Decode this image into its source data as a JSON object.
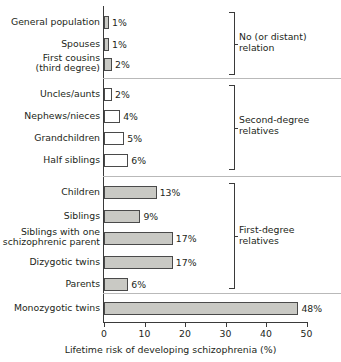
{
  "chart_data": {
    "type": "bar",
    "orientation": "horizontal",
    "title": "",
    "xlabel": "Lifetime risk of developing schizophrenia (%)",
    "ylabel": "",
    "xlim": [
      0,
      50
    ],
    "xticks": [
      0,
      10,
      20,
      30,
      40,
      50
    ],
    "xtick_labels": [
      "0",
      "10",
      "20",
      "30",
      "40",
      "50"
    ],
    "grid": false,
    "legend": false,
    "value_suffix": "%",
    "categories": [
      "General population",
      "Spouses",
      "First cousins\n(third degree)",
      "Uncles/aunts",
      "Nephews/nieces",
      "Grandchildren",
      "Half siblings",
      "Children",
      "Siblings",
      "Siblings with one\nschizophrenic parent",
      "Dizygotic twins",
      "Parents",
      "Monozygotic twins"
    ],
    "values": [
      1,
      1,
      2,
      2,
      4,
      5,
      6,
      13,
      9,
      17,
      17,
      6,
      48
    ],
    "value_labels": [
      "1%",
      "1%",
      "2%",
      "2%",
      "4%",
      "5%",
      "6%",
      "13%",
      "9%",
      "17%",
      "17%",
      "6%",
      "48%"
    ],
    "groups": [
      {
        "label": "No (or distant)\nrelation",
        "categories": [
          "General population",
          "Spouses",
          "First cousins (third degree)"
        ],
        "fill": "filled"
      },
      {
        "label": "Second-degree\nrelatives",
        "categories": [
          "Uncles/aunts",
          "Nephews/nieces",
          "Grandchildren",
          "Half siblings"
        ],
        "fill": "hollow"
      },
      {
        "label": "First-degree\nrelatives",
        "categories": [
          "Children",
          "Siblings",
          "Siblings with one schizophrenic parent",
          "Dizygotic twins",
          "Parents"
        ],
        "fill": "filled"
      },
      {
        "label": "",
        "categories": [
          "Monozygotic twins"
        ],
        "fill": "filled"
      }
    ],
    "colors": {
      "bar_fill": "#c9c9c4",
      "bar_hollow": "#ffffff",
      "bar_border": "#4a4a4a",
      "axis": "#3a3a3a",
      "separator": "#b9b9b9",
      "text": "#231f20",
      "background": "#ffffff"
    }
  },
  "rows": [
    {
      "label": "General population",
      "value_label": "1%",
      "value": 1,
      "fill": "filled",
      "top": 16,
      "two_line": false
    },
    {
      "label": "Spouses",
      "value_label": "1%",
      "value": 1,
      "fill": "filled",
      "top": 38,
      "two_line": false
    },
    {
      "label": "First cousins\n(third degree)",
      "value_label": "2%",
      "value": 2,
      "fill": "filled",
      "top": 58,
      "two_line": true
    },
    {
      "label": "Uncles/aunts",
      "value_label": "2%",
      "value": 2,
      "fill": "hollow",
      "top": 88,
      "two_line": false
    },
    {
      "label": "Nephews/nieces",
      "value_label": "4%",
      "value": 4,
      "fill": "hollow",
      "top": 110,
      "two_line": false
    },
    {
      "label": "Grandchildren",
      "value_label": "5%",
      "value": 5,
      "fill": "hollow",
      "top": 132,
      "two_line": false
    },
    {
      "label": "Half siblings",
      "value_label": "6%",
      "value": 6,
      "fill": "hollow",
      "top": 154,
      "two_line": false
    },
    {
      "label": "Children",
      "value_label": "13%",
      "value": 13,
      "fill": "filled",
      "top": 186,
      "two_line": false
    },
    {
      "label": "Siblings",
      "value_label": "9%",
      "value": 9,
      "fill": "filled",
      "top": 210,
      "two_line": false
    },
    {
      "label": "Siblings with one\nschizophrenic parent",
      "value_label": "17%",
      "value": 17,
      "fill": "filled",
      "top": 232,
      "two_line": true
    },
    {
      "label": "Dizygotic twins",
      "value_label": "17%",
      "value": 17,
      "fill": "filled",
      "top": 256,
      "two_line": false
    },
    {
      "label": "Parents",
      "value_label": "6%",
      "value": 6,
      "fill": "filled",
      "top": 278,
      "two_line": false
    },
    {
      "label": "Monozygotic twins",
      "value_label": "48%",
      "value": 48,
      "fill": "filled",
      "top": 302,
      "two_line": false
    }
  ],
  "groups": [
    {
      "label": "No (or distant)\nrelation",
      "top": 12,
      "height": 63,
      "label_top": 31
    },
    {
      "label": "Second-degree\nrelatives",
      "top": 85,
      "height": 85,
      "label_top": 114
    },
    {
      "label": "First-degree\nrelatives",
      "top": 183,
      "height": 106,
      "label_top": 224
    }
  ],
  "axis": {
    "title": "Lifetime risk of developing schizophrenia (%)",
    "ticks": [
      {
        "label": "0",
        "value": 0
      },
      {
        "label": "10",
        "value": 10
      },
      {
        "label": "20",
        "value": 20
      },
      {
        "label": "30",
        "value": 30
      },
      {
        "label": "40",
        "value": 40
      },
      {
        "label": "50",
        "value": 50
      }
    ]
  },
  "separators": [
    78,
    176,
    293
  ]
}
